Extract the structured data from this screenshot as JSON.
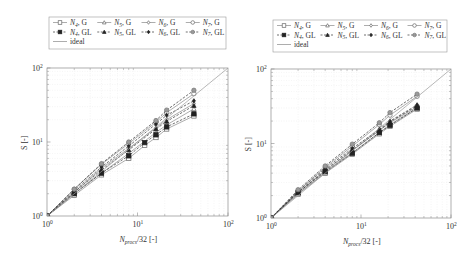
{
  "chart_data": [
    {
      "type": "line",
      "panel": "left",
      "xscale": "log",
      "yscale": "log",
      "xlabel": "N_procs/32 [-]",
      "ylabel": "S [-]",
      "xlim": [
        1,
        100
      ],
      "ylim": [
        1,
        100
      ],
      "xticks": [
        "10^0",
        "10^1",
        "10^2"
      ],
      "yticks": [
        "10^0",
        "10^1",
        "10^2"
      ],
      "grid": true,
      "legend_position": "top",
      "legend": [
        "N4, G",
        "N5, G",
        "N6, G",
        "N7, G",
        "N4, GL",
        "N5, GL",
        "N6, GL",
        "N7, GL",
        "ideal"
      ],
      "series": [
        {
          "name": "N4, G",
          "marker": "square-open",
          "dash": false,
          "x": [
            1,
            2,
            4,
            8,
            12,
            16,
            21,
            42
          ],
          "y": [
            1,
            1.9,
            3.6,
            6.0,
            9.0,
            11.5,
            15.0,
            22.5
          ]
        },
        {
          "name": "N5, G",
          "marker": "triangle-open",
          "dash": false,
          "x": [
            1,
            2,
            4,
            8,
            16,
            21,
            42
          ],
          "y": [
            1,
            2.0,
            3.8,
            7.0,
            13.5,
            17.0,
            28.0
          ]
        },
        {
          "name": "N6, G",
          "marker": "diamond-open",
          "dash": false,
          "x": [
            1,
            2,
            4,
            8,
            16,
            21,
            42
          ],
          "y": [
            1,
            2.1,
            4.4,
            8.2,
            15.5,
            20.0,
            33.0
          ]
        },
        {
          "name": "N7, G",
          "marker": "circle-open",
          "dash": false,
          "x": [
            1,
            2,
            4,
            8,
            16,
            21,
            42
          ],
          "y": [
            1,
            2.3,
            5.0,
            9.5,
            18.5,
            25.0,
            45.0
          ]
        },
        {
          "name": "N4, GL",
          "marker": "square-filled",
          "dash": true,
          "x": [
            1,
            2,
            4,
            8,
            12,
            16,
            21,
            42
          ],
          "y": [
            1,
            2.0,
            3.8,
            6.5,
            9.8,
            12.5,
            16.0,
            24.0
          ]
        },
        {
          "name": "N5, GL",
          "marker": "triangle-filled",
          "dash": true,
          "x": [
            1,
            2,
            4,
            8,
            16,
            21,
            42
          ],
          "y": [
            1,
            2.1,
            4.2,
            7.8,
            15.0,
            19.0,
            31.0
          ]
        },
        {
          "name": "N6, GL",
          "marker": "diamond-filled",
          "dash": true,
          "x": [
            1,
            2,
            4,
            8,
            16,
            21,
            42
          ],
          "y": [
            1,
            2.2,
            4.6,
            8.8,
            17.5,
            23.0,
            36.0
          ]
        },
        {
          "name": "N7, GL",
          "marker": "circle-filled",
          "dash": true,
          "x": [
            1,
            2,
            4,
            8,
            16,
            21,
            42
          ],
          "y": [
            1,
            2.3,
            5.1,
            10.0,
            19.5,
            27.0,
            50.0
          ]
        },
        {
          "name": "ideal",
          "marker": "none",
          "dash": false,
          "x": [
            1,
            100
          ],
          "y": [
            1,
            100
          ]
        }
      ]
    },
    {
      "type": "line",
      "panel": "right",
      "xscale": "log",
      "yscale": "log",
      "xlabel": "N_procs/32 [-]",
      "ylabel": "S [-]",
      "xlim": [
        1,
        100
      ],
      "ylim": [
        1,
        100
      ],
      "xticks": [
        "10^0",
        "10^1",
        "10^2"
      ],
      "yticks": [
        "10^0",
        "10^1",
        "10^2"
      ],
      "grid": true,
      "legend_position": "top",
      "legend": [
        "N4, G",
        "N5, G",
        "N6, G",
        "N7, G",
        "N4, GL",
        "N5, GL",
        "N6, GL",
        "N7, GL",
        "ideal"
      ],
      "series": [
        {
          "name": "N4, G",
          "marker": "square-open",
          "dash": false,
          "x": [
            1,
            2,
            4,
            8,
            16,
            21,
            42
          ],
          "y": [
            1,
            2.1,
            4.0,
            7.2,
            13.5,
            17.0,
            29.0
          ]
        },
        {
          "name": "N5, G",
          "marker": "triangle-open",
          "dash": false,
          "x": [
            1,
            2,
            4,
            8,
            16,
            21,
            42
          ],
          "y": [
            1,
            2.1,
            4.1,
            7.5,
            14.0,
            18.0,
            30.0
          ]
        },
        {
          "name": "N6, G",
          "marker": "diamond-open",
          "dash": false,
          "x": [
            1,
            2,
            4,
            8,
            16,
            21,
            42
          ],
          "y": [
            1,
            2.2,
            4.3,
            8.0,
            15.0,
            19.0,
            31.0
          ]
        },
        {
          "name": "N7, G",
          "marker": "circle-open",
          "dash": false,
          "x": [
            1,
            2,
            4,
            8,
            16,
            21,
            42
          ],
          "y": [
            1,
            2.3,
            4.8,
            9.2,
            18.0,
            24.0,
            43.0
          ]
        },
        {
          "name": "N4, GL",
          "marker": "square-filled",
          "dash": true,
          "x": [
            1,
            2,
            4,
            8,
            16,
            21,
            42
          ],
          "y": [
            1,
            2.2,
            4.2,
            7.4,
            14.0,
            17.5,
            30.0
          ]
        },
        {
          "name": "N5, GL",
          "marker": "triangle-filled",
          "dash": true,
          "x": [
            1,
            2,
            4,
            8,
            16,
            21,
            42
          ],
          "y": [
            1,
            2.2,
            4.4,
            8.2,
            15.0,
            19.5,
            32.0
          ]
        },
        {
          "name": "N6, GL",
          "marker": "diamond-filled",
          "dash": true,
          "x": [
            1,
            2,
            4,
            8,
            16,
            21,
            42
          ],
          "y": [
            1,
            2.3,
            4.6,
            8.6,
            15.5,
            20.0,
            33.0
          ]
        },
        {
          "name": "N7, GL",
          "marker": "circle-filled",
          "dash": true,
          "x": [
            1,
            2,
            4,
            8,
            16,
            21,
            42
          ],
          "y": [
            1,
            2.4,
            5.0,
            9.8,
            19.0,
            26.0,
            46.0
          ]
        },
        {
          "name": "ideal",
          "marker": "none",
          "dash": false,
          "x": [
            1,
            100
          ],
          "y": [
            1,
            100
          ]
        }
      ]
    }
  ],
  "labels": {
    "ylabel": "S [-]",
    "xlabel_main": "N",
    "xlabel_sub": "procs",
    "xlabel_rest": "/32 [-]",
    "tick_base": "10",
    "tick_exp": [
      "0",
      "1",
      "2"
    ]
  },
  "legend_items": [
    {
      "base": "N",
      "sub": "4",
      "suffix": ", G",
      "marker": "square-open",
      "dash": false
    },
    {
      "base": "N",
      "sub": "5",
      "suffix": ", G",
      "marker": "triangle-open",
      "dash": false
    },
    {
      "base": "N",
      "sub": "6",
      "suffix": ", G",
      "marker": "diamond-open",
      "dash": false
    },
    {
      "base": "N",
      "sub": "7",
      "suffix": ", G",
      "marker": "circle-open",
      "dash": false
    },
    {
      "base": "N",
      "sub": "4",
      "suffix": ", GL",
      "marker": "square-filled",
      "dash": true
    },
    {
      "base": "N",
      "sub": "5",
      "suffix": ", GL",
      "marker": "triangle-filled",
      "dash": true
    },
    {
      "base": "N",
      "sub": "6",
      "suffix": ", GL",
      "marker": "diamond-filled",
      "dash": true
    },
    {
      "base": "N",
      "sub": "7",
      "suffix": ", GL",
      "marker": "circle-filled",
      "dash": true
    },
    {
      "base": "ideal",
      "sub": "",
      "suffix": "",
      "marker": "none",
      "dash": false
    }
  ],
  "colors": {
    "G_line": "#8a8a8a",
    "GL_line": "#333333",
    "N7_fill": "#9a9a9a",
    "ideal": "#9a9a9a",
    "axis": "#8c8c8c",
    "grid": "#e6e6e6"
  }
}
